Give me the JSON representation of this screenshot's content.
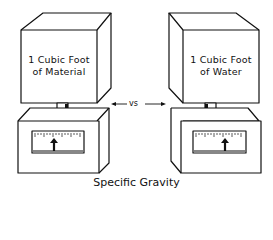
{
  "left_block": {
    "line1": "1 Cubic Foot",
    "line2": "of Material"
  },
  "right_block": {
    "line1": "1 Cubic Foot",
    "line2": "of Water"
  },
  "comparison_label": "vs",
  "caption": "Specific Gravity",
  "colors": {
    "stroke": "#111111",
    "background": "#ffffff"
  }
}
